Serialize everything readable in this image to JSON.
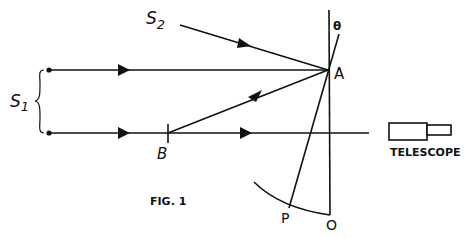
{
  "figure": {
    "caption": "FIG. 1",
    "labels": {
      "source1": "S",
      "source1_sub": "1",
      "source2": "S",
      "source2_sub": "2",
      "point_a": "A",
      "point_b": "B",
      "point_p": "P",
      "point_o": "O",
      "angle": "θ",
      "telescope": "TELESCOPE"
    },
    "colors": {
      "ink": "#111111",
      "background": "#ffffff"
    }
  }
}
